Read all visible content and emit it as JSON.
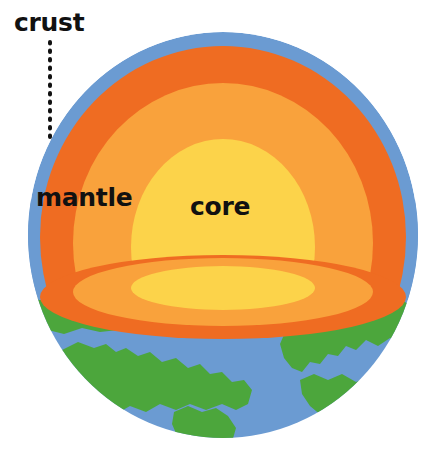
{
  "diagram": {
    "background_color": "#ffffff",
    "labels": {
      "crust": "crust",
      "mantle": "mantle",
      "core": "core"
    },
    "layers": [
      {
        "name": "crust",
        "color": "#6b9bd2",
        "description": "thin outer blue shell"
      },
      {
        "name": "land",
        "color": "#4ca63c",
        "description": "green continents on surface"
      },
      {
        "name": "outer-mantle",
        "color": "#ef6c22",
        "description": "deep orange band"
      },
      {
        "name": "inner-mantle",
        "color": "#f9a23c",
        "description": "light orange band"
      },
      {
        "name": "core",
        "color": "#fcd34a",
        "description": "yellow center"
      }
    ],
    "leader_line": {
      "style": "dotted",
      "color": "#111111",
      "from": "crust-label",
      "to": "crust-layer"
    }
  }
}
